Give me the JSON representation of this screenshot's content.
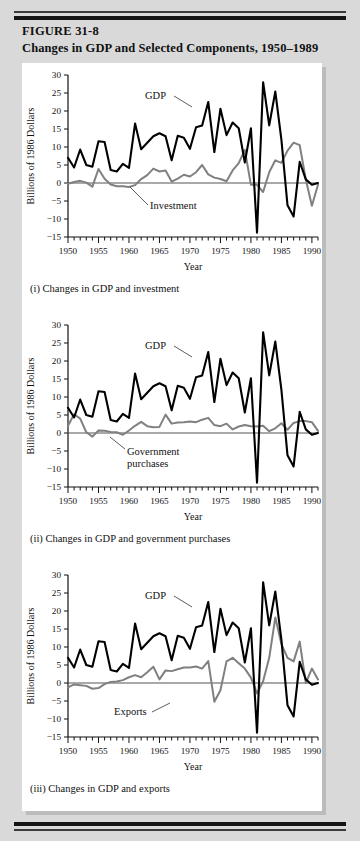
{
  "figure": {
    "number": "FIGURE 31-8",
    "title": "Changes in GDP and Selected Components, 1950–1989"
  },
  "panels": [
    {
      "id": "panel-investment",
      "caption": "(i) Changes in GDP and investment",
      "component_label": "Investment",
      "gdp_label": "GDP"
    },
    {
      "id": "panel-government",
      "caption": "(ii) Changes in GDP and government purchases",
      "component_label": "Government\npurchases",
      "component_label_line1": "Government",
      "component_label_line2": "purchases",
      "gdp_label": "GDP"
    },
    {
      "id": "panel-exports",
      "caption": "(iii) Changes in GDP and exports",
      "component_label": "Exports",
      "gdp_label": "GDP"
    }
  ],
  "chart_data": [
    {
      "type": "line",
      "id": "chart-gdp-investment",
      "title": "(i) Changes in GDP and investment",
      "xlabel": "Year",
      "ylabel": "Billions of 1986 Dollars",
      "xlim": [
        1950,
        1991
      ],
      "ylim": [
        -15,
        30
      ],
      "yticks": [
        -15,
        -10,
        -5,
        0,
        5,
        10,
        15,
        20,
        25,
        30
      ],
      "xticks": [
        1950,
        1955,
        1960,
        1965,
        1970,
        1975,
        1980,
        1985,
        1990
      ],
      "xtick_minor_step": 1,
      "grid": false,
      "legend": "inline-annotation",
      "zero_line": true,
      "x": [
        1950,
        1951,
        1952,
        1953,
        1954,
        1955,
        1956,
        1957,
        1958,
        1959,
        1960,
        1961,
        1962,
        1963,
        1964,
        1965,
        1966,
        1967,
        1968,
        1969,
        1970,
        1971,
        1972,
        1973,
        1974,
        1975,
        1976,
        1977,
        1978,
        1979,
        1980,
        1981,
        1982,
        1983,
        1984,
        1985,
        1986,
        1987,
        1988,
        1989,
        1990,
        1991
      ],
      "series": [
        {
          "name": "GDP",
          "color": "#000000",
          "width": 2.1,
          "values": [
            7.0,
            4.3,
            9.3,
            5.0,
            4.5,
            11.6,
            11.4,
            3.6,
            3.2,
            5.3,
            4.2,
            16.5,
            9.4,
            11.2,
            13.0,
            13.8,
            13.0,
            6.3,
            13.1,
            12.6,
            9.5,
            15.5,
            16.0,
            22.5,
            8.6,
            20.6,
            13.3,
            16.8,
            15.2,
            5.7,
            15.2,
            -13.8,
            28.0,
            16.0,
            25.4,
            12.0,
            -6.2,
            -9.3,
            5.9,
            1.0,
            -0.5,
            0.0
          ]
        },
        {
          "name": "Investment",
          "color": "#808080",
          "width": 2.0,
          "values": [
            -0.2,
            0.3,
            0.6,
            0.1,
            -1.0,
            3.9,
            1.2,
            -0.4,
            -0.9,
            -0.9,
            -1.1,
            -0.6,
            1.1,
            2.2,
            4.0,
            3.2,
            3.5,
            0.4,
            1.2,
            2.3,
            1.8,
            3.0,
            5.0,
            2.4,
            1.5,
            1.1,
            0.5,
            3.5,
            5.5,
            9.2,
            -0.5,
            -0.5,
            -2.5,
            3.0,
            6.3,
            5.6,
            9.0,
            11.2,
            10.5,
            1.0,
            -6.3,
            -0.5
          ]
        }
      ]
    },
    {
      "type": "line",
      "id": "chart-gdp-government",
      "title": "(ii) Changes in GDP and government purchases",
      "xlabel": "Year",
      "ylabel": "Billions of 1986 Dollars",
      "xlim": [
        1950,
        1991
      ],
      "ylim": [
        -15,
        30
      ],
      "yticks": [
        -15,
        -10,
        -5,
        0,
        5,
        10,
        15,
        20,
        25,
        30
      ],
      "xticks": [
        1950,
        1955,
        1960,
        1965,
        1970,
        1975,
        1980,
        1985,
        1990
      ],
      "xtick_minor_step": 1,
      "grid": false,
      "legend": "inline-annotation",
      "zero_line": true,
      "x": [
        1950,
        1951,
        1952,
        1953,
        1954,
        1955,
        1956,
        1957,
        1958,
        1959,
        1960,
        1961,
        1962,
        1963,
        1964,
        1965,
        1966,
        1967,
        1968,
        1969,
        1970,
        1971,
        1972,
        1973,
        1974,
        1975,
        1976,
        1977,
        1978,
        1979,
        1980,
        1981,
        1982,
        1983,
        1984,
        1985,
        1986,
        1987,
        1988,
        1989,
        1990,
        1991
      ],
      "series": [
        {
          "name": "GDP",
          "color": "#000000",
          "width": 2.1,
          "values": [
            7.0,
            4.3,
            9.3,
            5.0,
            4.5,
            11.6,
            11.4,
            3.6,
            3.2,
            5.3,
            4.2,
            16.5,
            9.4,
            11.2,
            13.0,
            13.8,
            13.0,
            6.3,
            13.1,
            12.6,
            9.5,
            15.5,
            16.0,
            22.5,
            8.6,
            20.6,
            13.3,
            16.8,
            15.2,
            5.7,
            15.2,
            -13.8,
            28.0,
            16.0,
            25.4,
            12.0,
            -6.2,
            -9.3,
            5.9,
            1.0,
            -0.5,
            0.0
          ]
        },
        {
          "name": "Government purchases",
          "color": "#808080",
          "width": 2.0,
          "values": [
            2.0,
            5.2,
            4.0,
            0.2,
            -1.0,
            0.7,
            0.6,
            0.3,
            0.2,
            -0.5,
            0.7,
            2.0,
            3.1,
            1.9,
            1.6,
            1.7,
            5.1,
            2.6,
            2.9,
            3.0,
            3.2,
            3.0,
            3.7,
            4.2,
            2.2,
            1.9,
            2.6,
            1.0,
            1.8,
            2.2,
            1.9,
            1.8,
            2.0,
            0.5,
            1.3,
            2.7,
            0.9,
            2.8,
            3.3,
            3.3,
            3.0,
            0.6
          ]
        }
      ]
    },
    {
      "type": "line",
      "id": "chart-gdp-exports",
      "title": "(iii) Changes in GDP and exports",
      "xlabel": "Year",
      "ylabel": "Billions of 1986 Dollars",
      "xlim": [
        1950,
        1991
      ],
      "ylim": [
        -15,
        30
      ],
      "yticks": [
        -15,
        -10,
        -5,
        0,
        5,
        10,
        15,
        20,
        25,
        30
      ],
      "xticks": [
        1950,
        1955,
        1960,
        1965,
        1970,
        1975,
        1980,
        1985,
        1990
      ],
      "xtick_minor_step": 1,
      "grid": false,
      "legend": "inline-annotation",
      "zero_line": true,
      "x": [
        1950,
        1951,
        1952,
        1953,
        1954,
        1955,
        1956,
        1957,
        1958,
        1959,
        1960,
        1961,
        1962,
        1963,
        1964,
        1965,
        1966,
        1967,
        1968,
        1969,
        1970,
        1971,
        1972,
        1973,
        1974,
        1975,
        1976,
        1977,
        1978,
        1979,
        1980,
        1981,
        1982,
        1983,
        1984,
        1985,
        1986,
        1987,
        1988,
        1989,
        1990,
        1991
      ],
      "series": [
        {
          "name": "GDP",
          "color": "#000000",
          "width": 2.1,
          "values": [
            7.0,
            4.3,
            9.3,
            5.0,
            4.5,
            11.6,
            11.4,
            3.6,
            3.2,
            5.3,
            4.2,
            16.5,
            9.4,
            11.2,
            13.0,
            13.8,
            13.0,
            6.3,
            13.1,
            12.6,
            9.5,
            15.5,
            16.0,
            22.5,
            8.6,
            20.6,
            13.3,
            16.8,
            15.2,
            5.7,
            15.2,
            -13.8,
            28.0,
            16.0,
            25.4,
            12.0,
            -6.2,
            -9.3,
            5.9,
            1.0,
            -0.5,
            0.0
          ]
        },
        {
          "name": "Exports",
          "color": "#808080",
          "width": 2.0,
          "values": [
            -1.2,
            -0.4,
            -0.6,
            -0.8,
            -1.6,
            -1.4,
            -0.3,
            0.3,
            0.4,
            0.8,
            1.6,
            2.2,
            1.6,
            3.0,
            4.5,
            1.0,
            3.5,
            3.3,
            3.8,
            4.3,
            4.3,
            4.6,
            4.0,
            6.1,
            -5.2,
            -2.0,
            6.0,
            7.0,
            5.5,
            4.0,
            1.5,
            -2.9,
            0.5,
            7.0,
            18.2,
            10.8,
            7.0,
            6.0,
            11.5,
            0.0,
            4.0,
            1.0
          ]
        }
      ]
    }
  ]
}
